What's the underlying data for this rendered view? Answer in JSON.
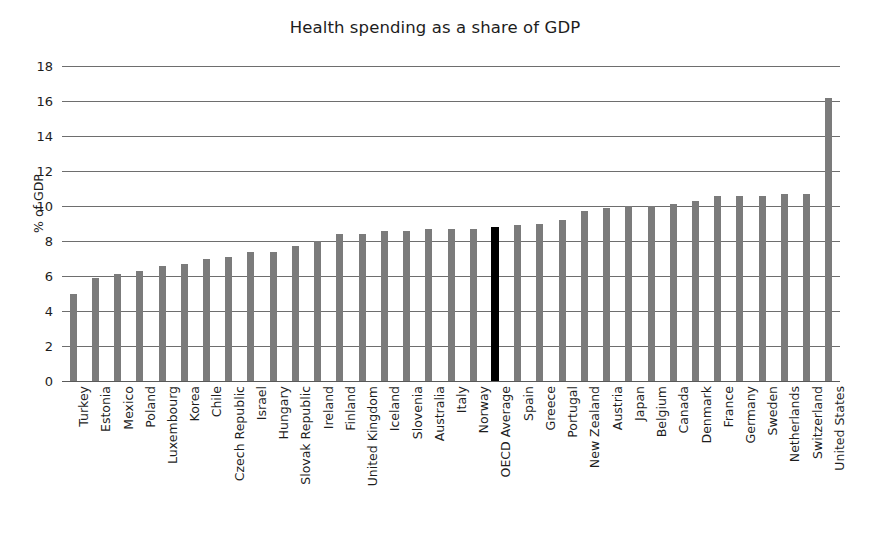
{
  "chart_data": {
    "type": "bar",
    "title": "Health spending as a share of GDP",
    "xlabel": "",
    "ylabel": "% of GDP",
    "ylim": [
      0,
      18
    ],
    "yticks": [
      0,
      2,
      4,
      6,
      8,
      10,
      12,
      14,
      16,
      18
    ],
    "grid": true,
    "legend": null,
    "orientation": "vertical",
    "bar_color": "#7b7b7b",
    "highlight_color": "#000000",
    "highlight_category": "OECD Average",
    "categories": [
      "Turkey",
      "Estonia",
      "Mexico",
      "Poland",
      "Luxembourg",
      "Korea",
      "Chile",
      "Czech Republic",
      "Israel",
      "Hungary",
      "Slovak Republic",
      "Ireland",
      "Finland",
      "United Kingdom",
      "Iceland",
      "Slovenia",
      "Australia",
      "Italy",
      "Norway",
      "OECD Average",
      "Spain",
      "Greece",
      "Portugal",
      "New Zealand",
      "Austria",
      "Japan",
      "Belgium",
      "Canada",
      "Denmark",
      "France",
      "Germany",
      "Sweden",
      "Netherlands",
      "Switzerland",
      "United States"
    ],
    "values": [
      5.0,
      5.9,
      6.1,
      6.3,
      6.6,
      6.7,
      7.0,
      7.1,
      7.4,
      7.4,
      7.7,
      8.0,
      8.4,
      8.4,
      8.6,
      8.6,
      8.7,
      8.7,
      8.7,
      8.8,
      8.9,
      9.0,
      9.2,
      9.7,
      9.9,
      10.0,
      10.0,
      10.1,
      10.3,
      10.6,
      10.6,
      10.6,
      10.7,
      10.7,
      16.2
    ]
  }
}
